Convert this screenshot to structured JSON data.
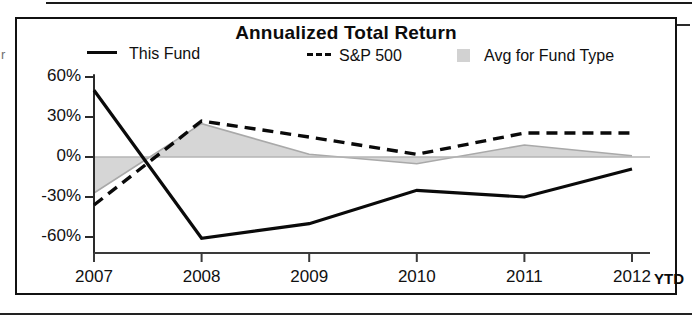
{
  "figure": {
    "title": "Annualized Total Return",
    "edge_mark": "r"
  },
  "legend": {
    "items": [
      {
        "label": "This Fund",
        "marker": "solid-line-swatch"
      },
      {
        "label": "S&P 500",
        "marker": "dashed-line-swatch"
      },
      {
        "label": "Avg for Fund Type",
        "marker": "shaded-area-swatch"
      }
    ]
  },
  "axes": {
    "y_ticks": [
      "60%",
      "30%",
      "0%",
      "-30%",
      "-60%"
    ],
    "x_ticks": [
      "2007",
      "2008",
      "2009",
      "2010",
      "2011",
      "2012"
    ],
    "x_suffix": "YTD"
  },
  "colors": {
    "line": "#0a0a0a",
    "area_fill": "#d6d6d6",
    "area_line": "#a8a8a8",
    "axis": "#1a1a1a",
    "frame": "#111111"
  },
  "chart_data": {
    "type": "line",
    "title": "Annualized Total Return",
    "xlabel": "",
    "ylabel": "",
    "x": [
      "2007",
      "2008",
      "2009",
      "2010",
      "2011",
      "2012"
    ],
    "x_tick_suffix": "YTD",
    "ylim": [
      -72,
      62
    ],
    "ytick_values": [
      60,
      30,
      0,
      -30,
      -60
    ],
    "ytick_labels": [
      "60%",
      "30%",
      "0%",
      "-30%",
      "-60%"
    ],
    "grid": false,
    "legend_position": "top",
    "series": [
      {
        "name": "This Fund",
        "style": "solid",
        "values": [
          50,
          -61,
          -50,
          -25,
          -30,
          -9
        ]
      },
      {
        "name": "S&P 500",
        "style": "dashed",
        "values": [
          -36,
          27,
          15,
          2,
          18,
          18
        ]
      },
      {
        "name": "Avg for Fund Type",
        "style": "filled-area",
        "values": [
          -27,
          25,
          2,
          -5,
          9,
          1
        ]
      }
    ]
  }
}
